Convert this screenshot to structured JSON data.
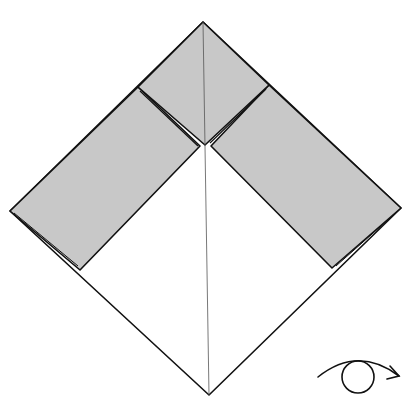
{
  "diagram": {
    "type": "origami-folding-step",
    "colors": {
      "paper_white": "#ffffff",
      "paper_colored": "#c8c8c8",
      "line": "#111111",
      "crease": "#555555"
    },
    "outline": {
      "top": [
        203,
        22
      ],
      "right": [
        401,
        208
      ],
      "bottom": [
        209,
        395
      ],
      "left": [
        10,
        211
      ]
    },
    "center_point": [
      205,
      145
    ],
    "flaps": [
      {
        "name": "top-flap",
        "points": [
          [
            203,
            22
          ],
          [
            269,
            85
          ],
          [
            205,
            145
          ],
          [
            138,
            87
          ]
        ]
      },
      {
        "name": "left-flap",
        "points": [
          [
            138,
            87
          ],
          [
            200,
            145
          ],
          [
            80,
            270
          ],
          [
            10,
            211
          ]
        ]
      },
      {
        "name": "right-flap",
        "points": [
          [
            269,
            85
          ],
          [
            401,
            208
          ],
          [
            332,
            268
          ],
          [
            210,
            145
          ]
        ]
      }
    ],
    "symbols": [
      {
        "name": "turn-over-symbol",
        "meaning": "turn over"
      }
    ]
  }
}
